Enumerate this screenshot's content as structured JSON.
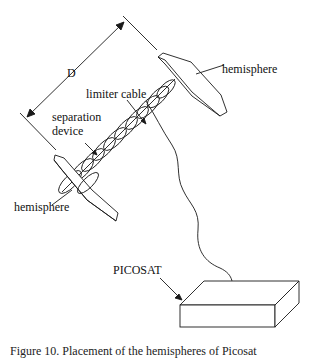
{
  "diagram": {
    "labels": {
      "dimension": "D",
      "hemisphere_top": "hemisphere",
      "hemisphere_bottom": "hemisphere",
      "limiter_cable": "limiter cable",
      "separation_device_line1": "separation",
      "separation_device_line2": "device",
      "picosat": "PICOSAT"
    },
    "caption": "Figure 10. Placement of the hemispheres of Picosat"
  },
  "colors": {
    "stroke": "#1a1a1a",
    "background": "#ffffff"
  }
}
